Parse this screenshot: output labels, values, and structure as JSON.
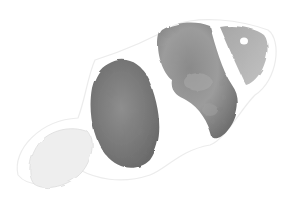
{
  "image": {
    "subject": "clownfish",
    "style": "grayscale watercolor illustration",
    "colors": {
      "background": "#ffffff",
      "dark_body": "#7d7d7d",
      "mid_body": "#9a9a9a",
      "light_tail": "#ececec",
      "head": "#b4b4b4",
      "outline": "#e6e6e6",
      "eye_highlight": "#ffffff"
    }
  }
}
